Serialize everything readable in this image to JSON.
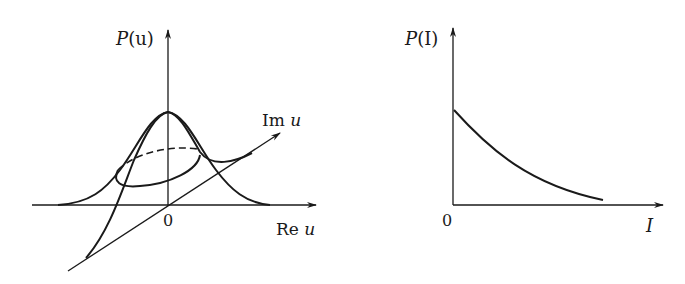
{
  "figure": {
    "left_panel": {
      "title": "P(u) distribution over complex plane",
      "y_axis_label": "P(u)",
      "re_axis_label": "Re u",
      "im_axis_label": "Im u",
      "origin_label": "0",
      "curves": [
        "bell-curve-real-section",
        "bell-curve-imag-section",
        "dashed-ellipse-back",
        "solid-ellipse-front"
      ]
    },
    "right_panel": {
      "title": "P(I) exponential decay",
      "y_axis_label": "P(I)",
      "x_axis_label": "I",
      "origin_label": "0",
      "curve": "decaying-exponential"
    }
  },
  "labels": {
    "P_u_main": "P",
    "P_u_arg": "(u)",
    "Re_prefix": "Re",
    "Re_var": "u",
    "Im_prefix": "Im",
    "Im_var": "u",
    "zero_left": "0",
    "P_I_main": "P",
    "P_I_arg": "(I)",
    "I_var": "I",
    "zero_right": "0"
  },
  "colors": {
    "ink": "#1a1a1a",
    "background": "#ffffff"
  }
}
